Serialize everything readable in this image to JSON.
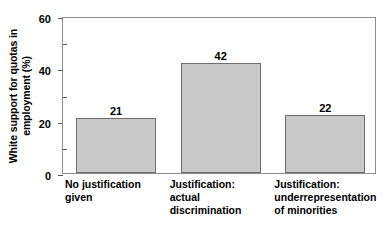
{
  "chart_data": {
    "type": "bar",
    "title": "",
    "xlabel": "",
    "ylabel": "White support for quotas in employment (%)",
    "ylabel_lines": [
      "White support for quotas in",
      "employment (%)"
    ],
    "categories": [
      "No justification given",
      "Justification: actual discrimination",
      "Justification: underrepresentation of minorities"
    ],
    "category_lines": [
      [
        "No justification",
        "given"
      ],
      [
        "Justification:",
        "actual",
        "discrimination"
      ],
      [
        "Justification:",
        "underrepresentation",
        "of minorities"
      ]
    ],
    "values": [
      21,
      42,
      22
    ],
    "value_labels": [
      "21",
      "42",
      "22"
    ],
    "ylim": [
      0,
      60
    ],
    "yticks": [
      0,
      20,
      40,
      60
    ],
    "ytick_labels": [
      "0",
      "20",
      "40",
      "60"
    ],
    "yticks_minor": [
      10,
      30,
      50
    ],
    "grid": false,
    "legend": false,
    "colors": {
      "bar_fill": "#c9c9c9",
      "bar_stroke": "#6e6e6e",
      "axis": "#8d8d8d",
      "tick": "#5a5a5a",
      "text": "#000000",
      "background": "#ffffff"
    }
  }
}
